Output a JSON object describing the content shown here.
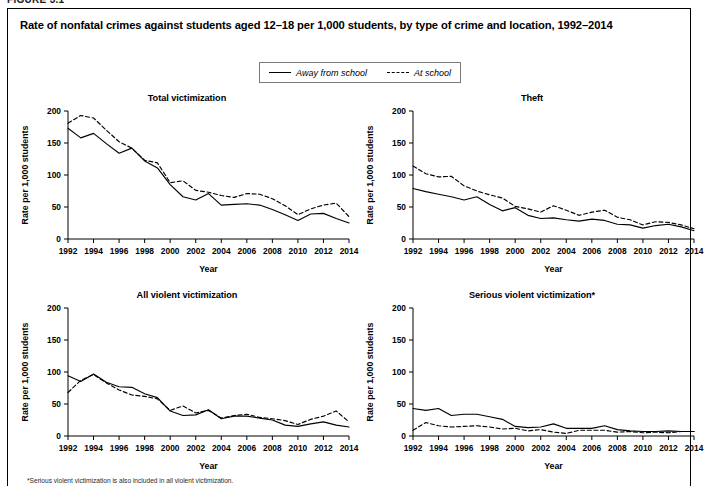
{
  "figure_number": "FIGURE 3.1",
  "title": "Rate of nonfatal crimes against students aged 12–18 per 1,000 students, by type of crime and location, 1992–2014",
  "legend": {
    "position": "top-center",
    "entries": [
      {
        "label": "Away from school",
        "style": "solid"
      },
      {
        "label": "At school",
        "style": "dashed"
      }
    ]
  },
  "footnote": "*Serious violent victimization is also included in all violent victimization.",
  "axis": {
    "xlabel": "Year",
    "ylabel": "Rate per 1,000 students",
    "yticks": [
      0,
      50,
      100,
      150,
      200
    ],
    "xticks": [
      1992,
      1994,
      1996,
      1998,
      2000,
      2002,
      2004,
      2006,
      2008,
      2010,
      2012,
      2014
    ],
    "ylim": [
      0,
      200
    ],
    "xlim": [
      1992,
      2014
    ],
    "grid": false
  },
  "chart_data": [
    {
      "type": "line",
      "title": "Total victimization",
      "xlabel": "Year",
      "ylabel": "Rate per 1,000 students",
      "ylim": [
        0,
        200
      ],
      "xlim": [
        1992,
        2014
      ],
      "grid": false,
      "x": [
        1992,
        1993,
        1994,
        1995,
        1996,
        1997,
        1998,
        1999,
        2000,
        2001,
        2002,
        2003,
        2004,
        2005,
        2006,
        2007,
        2008,
        2009,
        2010,
        2011,
        2012,
        2013,
        2014
      ],
      "series": [
        {
          "name": "Away from school",
          "style": "solid",
          "values": [
            173,
            158,
            165,
            149,
            134,
            142,
            122,
            111,
            85,
            66,
            61,
            71,
            53,
            54,
            55,
            53,
            46,
            38,
            29,
            39,
            40,
            32,
            25
          ]
        },
        {
          "name": "At school",
          "style": "dashed",
          "values": [
            181,
            193,
            189,
            170,
            152,
            142,
            123,
            119,
            88,
            91,
            76,
            73,
            68,
            65,
            71,
            70,
            63,
            52,
            38,
            47,
            53,
            56,
            35
          ]
        }
      ]
    },
    {
      "type": "line",
      "title": "Theft",
      "xlabel": "Year",
      "ylabel": "Rate per 1,000 students",
      "ylim": [
        0,
        200
      ],
      "xlim": [
        1992,
        2014
      ],
      "grid": false,
      "x": [
        1992,
        1993,
        1994,
        1995,
        1996,
        1997,
        1998,
        1999,
        2000,
        2001,
        2002,
        2003,
        2004,
        2005,
        2006,
        2007,
        2008,
        2009,
        2010,
        2011,
        2012,
        2013,
        2014
      ],
      "series": [
        {
          "name": "Away from school",
          "style": "solid",
          "values": [
            79,
            74,
            70,
            66,
            61,
            66,
            54,
            44,
            49,
            37,
            32,
            33,
            30,
            28,
            31,
            29,
            23,
            22,
            17,
            21,
            23,
            19,
            13
          ]
        },
        {
          "name": "At school",
          "style": "dashed",
          "values": [
            114,
            102,
            97,
            98,
            83,
            75,
            69,
            64,
            51,
            47,
            42,
            52,
            45,
            37,
            42,
            45,
            34,
            30,
            22,
            27,
            26,
            22,
            16
          ]
        }
      ]
    },
    {
      "type": "line",
      "title": "All violent victimization",
      "xlabel": "Year",
      "ylabel": "Rate per 1,000 students",
      "ylim": [
        0,
        200
      ],
      "xlim": [
        1992,
        2014
      ],
      "grid": false,
      "x": [
        1992,
        1993,
        1994,
        1995,
        1996,
        1997,
        1998,
        1999,
        2000,
        2001,
        2002,
        2003,
        2004,
        2005,
        2006,
        2007,
        2008,
        2009,
        2010,
        2011,
        2012,
        2013,
        2014
      ],
      "series": [
        {
          "name": "Away from school",
          "style": "solid",
          "values": [
            94,
            85,
            97,
            84,
            77,
            76,
            66,
            60,
            39,
            32,
            33,
            41,
            27,
            31,
            31,
            28,
            25,
            17,
            15,
            19,
            22,
            17,
            14
          ]
        },
        {
          "name": "At school",
          "style": "dashed",
          "values": [
            68,
            87,
            96,
            83,
            72,
            64,
            62,
            58,
            40,
            47,
            36,
            40,
            28,
            32,
            34,
            29,
            27,
            24,
            18,
            26,
            31,
            39,
            22
          ]
        }
      ]
    },
    {
      "type": "line",
      "title": "Serious violent victimization*",
      "xlabel": "Year",
      "ylabel": "Rate per 1,000 students",
      "ylim": [
        0,
        200
      ],
      "xlim": [
        1992,
        2014
      ],
      "grid": false,
      "x": [
        1992,
        1993,
        1994,
        1995,
        1996,
        1997,
        1998,
        1999,
        2000,
        2001,
        2002,
        2003,
        2004,
        2005,
        2006,
        2007,
        2008,
        2009,
        2010,
        2011,
        2012,
        2013,
        2014
      ],
      "series": [
        {
          "name": "Away from school",
          "style": "solid",
          "values": [
            43,
            40,
            43,
            32,
            34,
            34,
            30,
            26,
            15,
            13,
            14,
            19,
            12,
            12,
            12,
            16,
            10,
            8,
            7,
            7,
            8,
            7,
            7
          ]
        },
        {
          "name": "At school",
          "style": "dashed",
          "values": [
            9,
            21,
            16,
            14,
            15,
            16,
            14,
            11,
            12,
            8,
            10,
            6,
            4,
            9,
            9,
            9,
            6,
            7,
            5,
            6,
            5,
            7,
            7
          ]
        }
      ]
    }
  ]
}
